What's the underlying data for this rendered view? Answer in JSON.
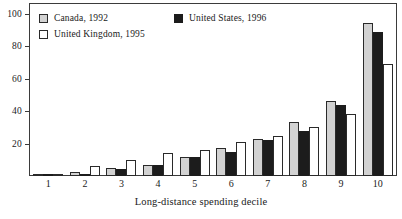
{
  "chart_data": {
    "type": "bar",
    "title": "",
    "xlabel": "Long-distance spending decile",
    "ylabel": "",
    "categories": [
      "1",
      "2",
      "3",
      "4",
      "5",
      "6",
      "7",
      "8",
      "9",
      "10"
    ],
    "series": [
      {
        "name": "Canada, 1992",
        "color": "#d2d2d2",
        "values": [
          0.5,
          2.5,
          5,
          7,
          12,
          17,
          23,
          33,
          46,
          94
        ]
      },
      {
        "name": "United States, 1996",
        "color": "#1c1c1c",
        "values": [
          0.5,
          1.5,
          4.5,
          6.5,
          12,
          15,
          22,
          28,
          43.5,
          89
        ]
      },
      {
        "name": "United Kingdom, 1995",
        "color": "#ffffff",
        "values": [
          1.5,
          6,
          10,
          14,
          16,
          21,
          24.5,
          30,
          38.5,
          69
        ]
      }
    ],
    "ylim": [
      0,
      106
    ],
    "yticks": [
      20,
      40,
      60,
      80,
      100
    ],
    "ytick_labels": [
      "20",
      "40",
      "60",
      "80",
      "100"
    ],
    "grid": false,
    "legend_position": "top-left"
  },
  "legend": {
    "entries": [
      {
        "label": "Canada, 1992"
      },
      {
        "label": "United States, 1996"
      },
      {
        "label": "United Kingdom, 1995"
      }
    ]
  }
}
